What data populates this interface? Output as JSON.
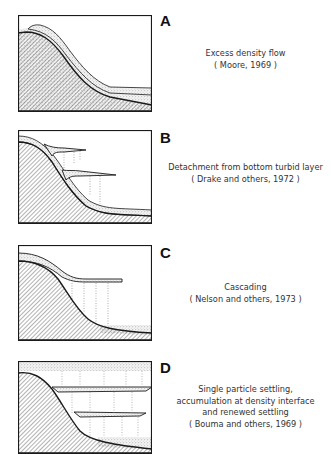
{
  "panels": [
    {
      "letter": "A",
      "lines": [
        "Excess density flow",
        "( Moore, 1969 )"
      ]
    },
    {
      "letter": "B",
      "lines": [
        "Detachment from bottom turbid layer",
        "( Drake and others, 1972 )"
      ]
    },
    {
      "letter": "C",
      "lines": [
        "Cascading",
        "( Nelson and others, 1973 )"
      ]
    },
    {
      "letter": "D",
      "lines": [
        "Single particle settling,",
        "accumulation at density interface",
        "and renewed settling",
        "( Bouma and others, 1969 )"
      ]
    }
  ],
  "colors": {
    "line": "#1a1a1a",
    "hatch": "#555555",
    "stipple": "#888888",
    "background": "#ffffff"
  }
}
